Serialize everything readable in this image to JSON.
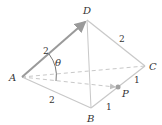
{
  "figure": {
    "type": "tetrahedron",
    "vertices": {
      "A": {
        "label": "A",
        "x": 22,
        "y": 77
      },
      "B": {
        "label": "B",
        "x": 91,
        "y": 108
      },
      "C": {
        "label": "C",
        "x": 145,
        "y": 66
      },
      "D": {
        "label": "D",
        "x": 87,
        "y": 20
      }
    },
    "point_P": {
      "label": "P",
      "x": 118,
      "y": 87
    },
    "angle_label": "θ",
    "edge_labels": {
      "AD": "2",
      "DC": "2",
      "AB": "2",
      "CP": "1",
      "PB": "1"
    },
    "colors": {
      "edge": "#c8c8c8",
      "vector": "#9a9a9a",
      "point": "#a0a0a0",
      "text": "#333333"
    }
  }
}
